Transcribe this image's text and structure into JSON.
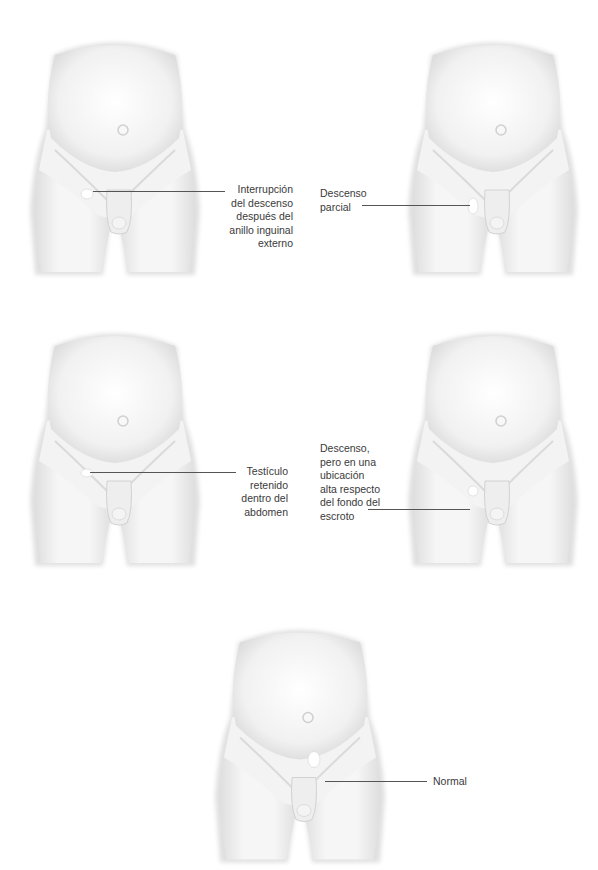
{
  "colors": {
    "skin": "#f2f2f2",
    "shadow": "#cfcfcf",
    "leader_line": "#555555",
    "text": "#3a3a3a",
    "testis_highlight": "#ffffff"
  },
  "panels": [
    {
      "id": "top-left",
      "label_lines": [
        "Interrupción",
        "del descenso",
        "después del",
        "anillo inguinal",
        "externo"
      ],
      "label_text": "Interrupción del descenso después del anillo inguinal externo"
    },
    {
      "id": "top-right",
      "label_lines": [
        "Descenso",
        "parcial"
      ],
      "label_text": "Descenso parcial"
    },
    {
      "id": "middle-left",
      "label_lines": [
        "Testículo",
        "retenido",
        "dentro del",
        "abdomen"
      ],
      "label_text": "Testículo retenido dentro del abdomen"
    },
    {
      "id": "middle-right",
      "label_lines": [
        "Descenso,",
        "pero en una",
        "ubicación",
        "alta respecto",
        "del fondo del",
        "escroto"
      ],
      "label_text": "Descenso, pero en una ubicación alta respecto del fondo del escroto"
    },
    {
      "id": "bottom-center",
      "label_lines": [
        "Normal"
      ],
      "label_text": "Normal"
    }
  ]
}
